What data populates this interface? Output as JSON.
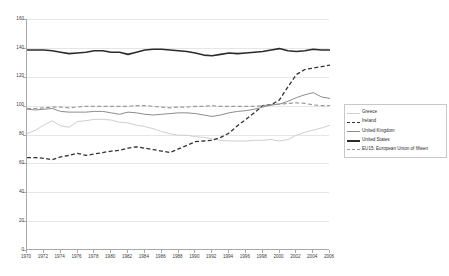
{
  "chart_data": {
    "type": "line",
    "title": "",
    "xlabel": "",
    "ylabel": "",
    "ylim": [
      0,
      160
    ],
    "xlim": [
      1970,
      2006
    ],
    "y_ticks": [
      0,
      20,
      40,
      60,
      80,
      100,
      120,
      140,
      160
    ],
    "x_ticks": [
      1970,
      1972,
      1974,
      1976,
      1978,
      1980,
      1982,
      1984,
      1986,
      1988,
      1990,
      1992,
      1994,
      1996,
      1998,
      2000,
      2002,
      2004,
      2006
    ],
    "grid": true,
    "legend_position": "right",
    "x": [
      1970,
      1971,
      1972,
      1973,
      1974,
      1975,
      1976,
      1977,
      1978,
      1979,
      1980,
      1981,
      1982,
      1983,
      1984,
      1985,
      1986,
      1987,
      1988,
      1989,
      1990,
      1991,
      1992,
      1993,
      1994,
      1995,
      1996,
      1997,
      1998,
      1999,
      2000,
      2001,
      2002,
      2003,
      2004,
      2005,
      2006
    ],
    "series": [
      {
        "name": "Greece",
        "color": "#cfcfcf",
        "style": "solid",
        "width": 1.0,
        "values": [
          80.5,
          83.0,
          86.5,
          89.5,
          86.0,
          85.0,
          89.0,
          89.5,
          90.5,
          90.5,
          90.0,
          88.5,
          88.0,
          86.5,
          85.5,
          84.0,
          82.0,
          80.5,
          79.5,
          79.5,
          78.5,
          78.0,
          77.0,
          76.0,
          75.5,
          75.5,
          75.5,
          76.0,
          76.0,
          76.5,
          75.5,
          76.5,
          79.5,
          81.5,
          83.0,
          84.5,
          86.5
        ]
      },
      {
        "name": "Ireland",
        "color": "#333333",
        "style": "dashed",
        "width": 1.3,
        "values": [
          64.0,
          64.0,
          63.5,
          62.5,
          64.5,
          65.5,
          67.0,
          65.5,
          66.5,
          67.5,
          68.5,
          69.0,
          70.5,
          71.5,
          70.5,
          69.5,
          68.5,
          67.5,
          70.0,
          72.5,
          75.0,
          75.5,
          76.0,
          78.0,
          81.0,
          86.0,
          90.5,
          95.0,
          100.0,
          100.5,
          104.0,
          113.0,
          121.5,
          125.0,
          126.0,
          127.0,
          128.0
        ]
      },
      {
        "name": "United Kingdom",
        "color": "#8c8c8c",
        "style": "solid",
        "width": 1.0,
        "values": [
          97.5,
          97.0,
          97.5,
          98.0,
          96.0,
          95.5,
          95.5,
          95.5,
          96.0,
          96.0,
          95.0,
          94.0,
          95.5,
          95.0,
          94.0,
          93.5,
          94.0,
          94.5,
          95.0,
          95.0,
          94.5,
          93.5,
          92.5,
          93.5,
          95.0,
          96.0,
          96.5,
          97.5,
          99.0,
          100.5,
          101.0,
          103.0,
          105.5,
          107.5,
          109.0,
          106.0,
          105.0
        ]
      },
      {
        "name": "United States",
        "color": "#2b2b2b",
        "style": "solid",
        "width": 1.6,
        "values": [
          138.5,
          138.5,
          138.5,
          138.0,
          137.0,
          136.0,
          136.5,
          137.0,
          138.0,
          138.0,
          137.0,
          137.0,
          135.5,
          137.0,
          138.5,
          139.0,
          139.0,
          138.5,
          138.0,
          137.5,
          136.5,
          135.0,
          134.5,
          135.5,
          136.5,
          136.0,
          136.5,
          137.0,
          137.5,
          138.5,
          139.5,
          138.0,
          137.5,
          138.0,
          139.0,
          138.5,
          138.5
        ]
      },
      {
        "name": "EU15: European Union of fifteen",
        "color": "#9a9a9a",
        "style": "dashed",
        "width": 1.2,
        "values": [
          98.0,
          98.0,
          98.5,
          99.0,
          99.0,
          98.5,
          99.0,
          99.5,
          99.5,
          99.5,
          99.5,
          99.5,
          99.5,
          100.0,
          100.0,
          99.5,
          99.0,
          98.5,
          99.0,
          99.0,
          99.5,
          99.5,
          100.0,
          99.5,
          99.5,
          99.5,
          99.5,
          99.5,
          100.0,
          100.5,
          101.0,
          101.5,
          102.0,
          101.5,
          100.5,
          100.0,
          100.0
        ]
      }
    ]
  },
  "legend": {
    "items": [
      {
        "label": "Greece"
      },
      {
        "label": "Ireland"
      },
      {
        "label": "United Kingdom"
      },
      {
        "label": "United States"
      },
      {
        "label": "EU15: European Union of fifteen"
      }
    ]
  }
}
